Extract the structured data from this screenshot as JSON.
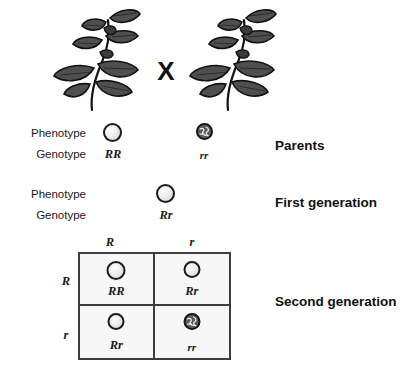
{
  "diagram": {
    "cross_symbol": "X"
  },
  "colors": {
    "round_pea_fill": "#ededed",
    "wrinkled_pea_fill": "#5a5a5a",
    "outline": "#1c1c1c",
    "grid_line": "#3d3d3d",
    "grid_fill": "#f7f7f7",
    "text": "#1a1a1a",
    "leaf_fill": "#4a4a4a"
  },
  "parents": {
    "generation_label": "Parents",
    "phenotype_label": "Phenotype",
    "genotype_label": "Genotype",
    "left": {
      "genotype": "RR",
      "phenotype": "round",
      "pea_icon": "round-pea-icon"
    },
    "right": {
      "genotype": "rr",
      "phenotype": "wrinkled",
      "pea_icon": "wrinkled-pea-icon"
    }
  },
  "first_generation": {
    "generation_label": "First generation",
    "phenotype_label": "Phenotype",
    "genotype_label": "Genotype",
    "offspring": {
      "genotype": "Rr",
      "phenotype": "round",
      "pea_icon": "round-pea-icon"
    }
  },
  "second_generation": {
    "generation_label": "Second generation",
    "column_headers": [
      "R",
      "r"
    ],
    "row_headers": [
      "R",
      "r"
    ],
    "cells": [
      [
        {
          "genotype": "RR",
          "phenotype": "round",
          "pea_icon": "round-pea-icon"
        },
        {
          "genotype": "Rr",
          "phenotype": "round",
          "pea_icon": "round-pea-icon"
        }
      ],
      [
        {
          "genotype": "Rr",
          "phenotype": "round",
          "pea_icon": "round-pea-icon"
        },
        {
          "genotype": "rr",
          "phenotype": "wrinkled",
          "pea_icon": "wrinkled-pea-icon"
        }
      ]
    ]
  },
  "plants": {
    "left_plant_name": "pea-plant-round",
    "right_plant_name": "pea-plant-wrinkled"
  }
}
